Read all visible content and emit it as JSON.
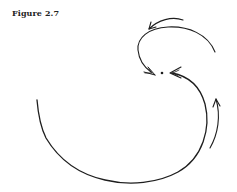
{
  "figure": {
    "label": "Figure 2.7"
  },
  "diagram": {
    "center_point": {
      "x": 162,
      "y": 73
    },
    "stroke_color": "#1e1e1e",
    "elements": [
      {
        "name": "top-short-arrow",
        "direction": "leftward"
      },
      {
        "name": "upper-arc-arrow",
        "direction": "toward-center-from-left"
      },
      {
        "name": "lower-large-arc-arrow",
        "direction": "toward-center-from-right"
      },
      {
        "name": "right-small-arrow",
        "direction": "upward"
      }
    ]
  }
}
